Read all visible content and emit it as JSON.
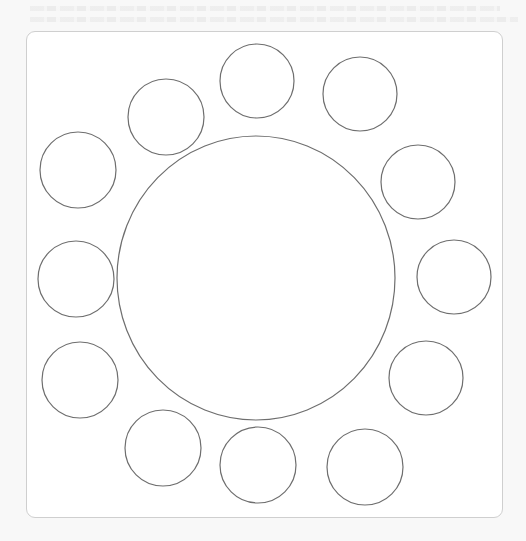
{
  "diagram": {
    "stroke_color": "#6e6e6e",
    "frame_border_color": "#cfcfcf",
    "background_color": "#f8f8f8",
    "frame_fill_color": "#ffffff",
    "center_circle": {
      "cx": 256,
      "cy": 278,
      "rx": 139,
      "ry": 142
    },
    "outer_circles": [
      {
        "position": "top",
        "cx": 257,
        "cy": 81,
        "r": 37
      },
      {
        "position": "top-right",
        "cx": 360,
        "cy": 94,
        "r": 37
      },
      {
        "position": "right-upper",
        "cx": 418,
        "cy": 182,
        "r": 37
      },
      {
        "position": "right",
        "cx": 454,
        "cy": 277,
        "r": 37
      },
      {
        "position": "right-lower",
        "cx": 426,
        "cy": 378,
        "r": 37
      },
      {
        "position": "bottom-right",
        "cx": 365,
        "cy": 467,
        "r": 38
      },
      {
        "position": "bottom",
        "cx": 258,
        "cy": 465,
        "r": 38
      },
      {
        "position": "bottom-left",
        "cx": 163,
        "cy": 448,
        "r": 38
      },
      {
        "position": "left-lower",
        "cx": 80,
        "cy": 380,
        "r": 38
      },
      {
        "position": "left",
        "cx": 76,
        "cy": 279,
        "r": 38
      },
      {
        "position": "left-upper",
        "cx": 78,
        "cy": 170,
        "r": 38
      },
      {
        "position": "top-left",
        "cx": 166,
        "cy": 117,
        "r": 38
      }
    ]
  }
}
